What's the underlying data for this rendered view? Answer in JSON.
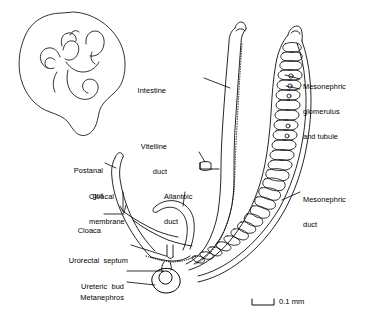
{
  "figure": {
    "type": "anatomical-line-diagram",
    "background_color": "#ffffff",
    "ink_color": "#000000"
  },
  "labels": [
    {
      "id": "intestine",
      "name": "intestine",
      "lines": [
        "Intestine"
      ],
      "align": "right",
      "x": 166,
      "y": 74
    },
    {
      "id": "mesonephric-glomerulus",
      "name": "mesonephric-glomerulus-and-tubule",
      "lines": [
        "Mesonephric",
        "glomerulus",
        "and tubule"
      ],
      "align": "left",
      "x": 303,
      "y": 70
    },
    {
      "id": "vitelline-duct",
      "name": "vitelline-duct",
      "lines": [
        "Vitelline",
        "duct"
      ],
      "align": "right",
      "x": 167,
      "y": 130
    },
    {
      "id": "postanal-gut",
      "name": "postanal-gut",
      "lines": [
        "Postanal",
        "gut"
      ],
      "align": "right",
      "x": 103,
      "y": 154
    },
    {
      "id": "cloacal-membrane",
      "name": "cloacal-membrane",
      "lines": [
        "Cloacal",
        "membrane"
      ],
      "align": "left",
      "x": 89,
      "y": 180
    },
    {
      "id": "allantoic-duct",
      "name": "allantoic-duct",
      "lines": [
        "Allantoic",
        "duct"
      ],
      "align": "left",
      "x": 171,
      "y": 180
    },
    {
      "id": "mesonephric-duct",
      "name": "mesonephric-duct",
      "lines": [
        "Mesonephric",
        "duct"
      ],
      "align": "left",
      "x": 303,
      "y": 183
    },
    {
      "id": "cloaca",
      "name": "cloaca",
      "lines": [
        "Cloaca"
      ],
      "align": "right",
      "x": 101,
      "y": 210
    },
    {
      "id": "urorectal-septum",
      "name": "urorectal-septum",
      "lines": [
        "Urorectal  septum"
      ],
      "align": "right",
      "x": 128,
      "y": 243
    },
    {
      "id": "ureteric-bud",
      "name": "ureteric-bud",
      "lines": [
        "Ureteric  bud"
      ],
      "align": "right",
      "x": 124,
      "y": 268
    },
    {
      "id": "metanephros",
      "name": "metanephros",
      "lines": [
        "Metanephros"
      ],
      "align": "right",
      "x": 124,
      "y": 279
    }
  ],
  "scale_bar": {
    "name": "scale-bar",
    "label": "0.1 mm",
    "x": 252,
    "y": 300,
    "width": 22,
    "tick_height": 6
  }
}
